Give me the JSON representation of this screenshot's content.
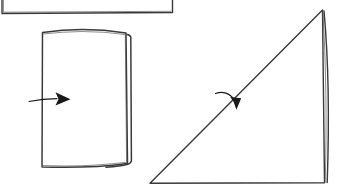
{
  "canvas": {
    "title": "Hand-drawn geometric sketch",
    "width": 351,
    "height": 192,
    "background_color": "#ffffff",
    "ink_color": "#333333",
    "ink_color_light": "#555555",
    "arrow_color": "#1a1a1a",
    "medium": "pencil-on-paper line drawing",
    "description": "Three hand-drawn shapes: a cropped rectangle at top-left, a book-like rectangle with a right-pointing arrow, and a right triangle with a curved arrow crossing its hypotenuse"
  },
  "shapes": [
    {
      "id": "cropped-rectangle",
      "name": "cropped-rectangle",
      "label": "Cropped rectangle (top-left, extends past canvas edges)",
      "type": "rectangle",
      "stroke_width": 1.4,
      "color": "#3a3a3a",
      "outline_path": "M 2 -14 L 2 13.5 L 172.5 12.5 L 172.5 -14",
      "double_edge_path": "M 3.4 -14 L 3.4 12.2 L 171 11.3"
    },
    {
      "id": "book-rectangle",
      "name": "book-rectangle",
      "label": "Book-like rectangle with slightly bowed edges",
      "type": "rectangle-book",
      "stroke_width": 1.5,
      "color": "#3a3a3a",
      "front_face_path": "M 42.5 32.5 C 70 28.5 100 29 126 33 L 127.5 163.5 C 98 167.5 68 167.8 42 167 Z",
      "back_page_path": "M 127.2 34.5 C 129.6 35.2 130.6 36.0 130.8 37.2 L 131.4 160.5 C 131.2 162.4 130.0 163.6 127.8 164.2 C 122 165.8 112 166.8 106 167.2",
      "inner_fold_path": "M 42.9 34.0 C 70 30.4 99 30.8 125.3 34.6 L 126.6 162.3 C 98 166.0 68.5 166.4 42.6 165.6"
    },
    {
      "id": "right-triangle",
      "name": "right-triangle",
      "label": "Right triangle with doubled vertical right edge",
      "type": "triangle",
      "stroke_width": 1.4,
      "color": "#3a3a3a",
      "outline_path": "M 150 183.2 L 322.5 10 L 324.5 182.8 Z",
      "double_edge_path": "M 324 11 C 328.5 60 329.2 125 327.2 182.6",
      "inner_edge_path": "M 322.8 12 C 326.2 62 326.8 126 325.2 182.4"
    }
  ],
  "arrows": [
    {
      "id": "rectangle-arrow",
      "name": "rectangle-arrow",
      "label": "Straight right-pointing arrow entering the book rectangle",
      "direction": "right",
      "color": "#1a1a1a",
      "tail_path": "M 29 101.5 C 38 99.6 48 98.6 57 98.6",
      "tail_width": 1.2,
      "head_points": "55.5,92.2 70.5,99.2 55.5,105.6 58.5,99.0",
      "tip_x": 70.5,
      "tip_y": 99.2
    },
    {
      "id": "triangle-arrow",
      "name": "triangle-arrow",
      "label": "Curved arrow pointing down-right across the triangle hypotenuse",
      "direction": "down-right",
      "color": "#1a1a1a",
      "tail_path": "M 215.5 93.5 C 222.5 91.2 229.5 93.2 234 99.5",
      "tail_width": 1.3,
      "head_points": "230.2,97.0 241.2,98.2 236.4,109.8 233.6,101.8",
      "tip_x": 236.4,
      "tip_y": 109.8
    }
  ],
  "legend": {
    "shape_count": "3",
    "arrow_count": "2"
  }
}
